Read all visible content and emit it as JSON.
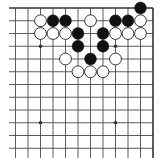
{
  "board": {
    "description": "Go problem diagram, top-right corner of a 19x19 board",
    "colors": {
      "background": "#ffffff",
      "line": "#333333",
      "black_stone": "#111111",
      "white_stone": "#ffffff",
      "white_outline": "#222222"
    },
    "grid": {
      "x0": 3,
      "dx": 12.5,
      "cols": 13,
      "y0": 8,
      "dy": 12.75,
      "rows": 13,
      "right_edge_col": 12,
      "top_edge_row": 0,
      "line_start_x": 9
    },
    "star_points": [
      [
        3,
        3
      ],
      [
        9,
        3
      ],
      [
        3,
        9
      ],
      [
        9,
        9
      ]
    ],
    "stones": [
      {
        "color": "black",
        "col": 11,
        "row": 0
      },
      {
        "color": "white",
        "col": 3,
        "row": 1
      },
      {
        "color": "black",
        "col": 4,
        "row": 1
      },
      {
        "color": "black",
        "col": 5,
        "row": 1
      },
      {
        "color": "white",
        "col": 7,
        "row": 1
      },
      {
        "color": "black",
        "col": 9,
        "row": 1
      },
      {
        "color": "black",
        "col": 10,
        "row": 1
      },
      {
        "color": "white",
        "col": 11,
        "row": 1
      },
      {
        "color": "white",
        "col": 3,
        "row": 2
      },
      {
        "color": "white",
        "col": 4,
        "row": 2
      },
      {
        "color": "white",
        "col": 5,
        "row": 2
      },
      {
        "color": "black",
        "col": 6,
        "row": 2
      },
      {
        "color": "black",
        "col": 8,
        "row": 2
      },
      {
        "color": "white",
        "col": 9,
        "row": 2
      },
      {
        "color": "white",
        "col": 10,
        "row": 2
      },
      {
        "color": "white",
        "col": 11,
        "row": 2
      },
      {
        "color": "black",
        "col": 6,
        "row": 3
      },
      {
        "color": "black",
        "col": 8,
        "row": 3
      },
      {
        "color": "white",
        "col": 5,
        "row": 4
      },
      {
        "color": "black",
        "col": 7,
        "row": 4
      },
      {
        "color": "white",
        "col": 9,
        "row": 4
      },
      {
        "color": "white",
        "col": 6,
        "row": 5
      },
      {
        "color": "white",
        "col": 7,
        "row": 5
      },
      {
        "color": "white",
        "col": 8,
        "row": 5
      }
    ]
  }
}
